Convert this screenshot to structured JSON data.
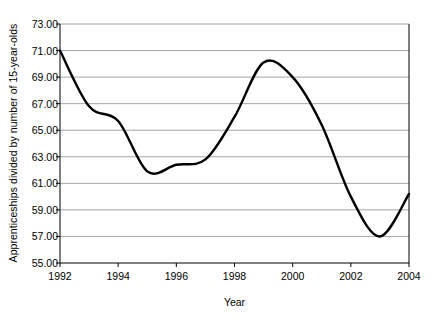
{
  "chart_data": {
    "type": "line",
    "title": "",
    "xlabel": "Year",
    "ylabel": "Apprenticeships divided by number of 15-year-olds",
    "xlim": [
      1992,
      2004
    ],
    "ylim": [
      55.0,
      73.0
    ],
    "grid": "horizontal",
    "legend": "none",
    "x_tick_labels": [
      "1992",
      "1994",
      "1996",
      "1998",
      "2000",
      "2002",
      "2004"
    ],
    "x_ticks": [
      1992,
      1994,
      1996,
      1998,
      2000,
      2002,
      2004
    ],
    "y_tick_labels": [
      "55.00",
      "57.00",
      "59.00",
      "61.00",
      "63.00",
      "65.00",
      "67.00",
      "69.00",
      "71.00",
      "73.00"
    ],
    "y_ticks": [
      55.0,
      57.0,
      59.0,
      61.0,
      63.0,
      65.0,
      67.0,
      69.0,
      71.0,
      73.0
    ],
    "series": [
      {
        "name": "Apprenticeships per 15-year-olds",
        "color": "#000000",
        "x": [
          1992,
          1993,
          1994,
          1995,
          1996,
          1997,
          1998,
          1999,
          2000,
          2001,
          2002,
          2003,
          2004
        ],
        "values": [
          71.0,
          66.8,
          65.7,
          61.9,
          62.4,
          62.8,
          66.0,
          70.1,
          69.0,
          65.4,
          60.0,
          57.0,
          60.2
        ]
      }
    ]
  },
  "axes": {
    "y_title": "Apprenticeships divided by number of 15-year-olds",
    "x_title": "Year"
  }
}
